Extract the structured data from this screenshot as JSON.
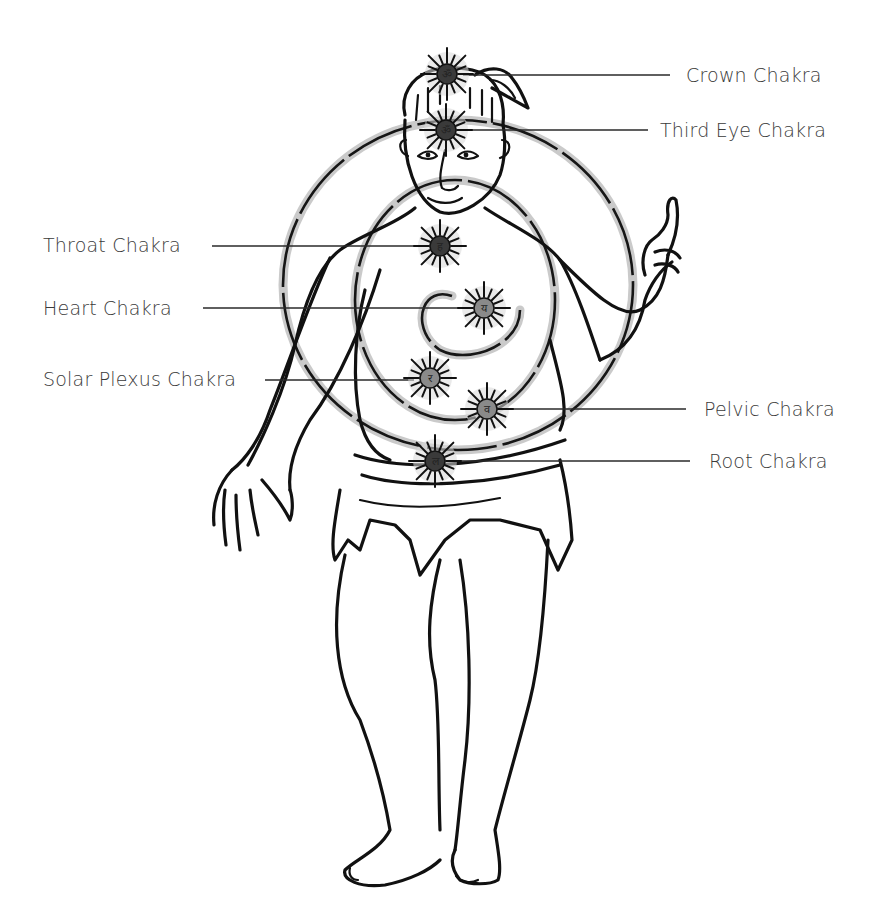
{
  "diagram": {
    "title": "",
    "colors": {
      "ink": "#111111",
      "label_text": "#3a3a3a",
      "halo": "#bdbdbd",
      "chakra_core_dark": "#3a3a3a",
      "chakra_core_light": "#8a8a8a",
      "background": "#ffffff"
    },
    "chakras": [
      {
        "id": "crown",
        "label": "Crown Chakra",
        "side": "right",
        "cx": 447,
        "cy": 74,
        "glyph": "ॐ",
        "label_x": 686,
        "label_y": 64,
        "line_x1": 463,
        "line_x2": 670
      },
      {
        "id": "third-eye",
        "label": "Third Eye Chakra",
        "side": "right",
        "cx": 446,
        "cy": 130,
        "glyph": "ॐ",
        "label_x": 660,
        "label_y": 119,
        "line_x1": 462,
        "line_x2": 648
      },
      {
        "id": "throat",
        "label": "Throat Chakra",
        "side": "left",
        "cx": 440,
        "cy": 246,
        "glyph": "ह",
        "label_x": 43,
        "label_y": 234,
        "line_x1": 212,
        "line_x2": 425
      },
      {
        "id": "heart",
        "label": "Heart Chakra",
        "side": "left",
        "cx": 484,
        "cy": 308,
        "glyph": "य",
        "label_x": 43,
        "label_y": 297,
        "line_x1": 203,
        "line_x2": 468
      },
      {
        "id": "solar-plexus",
        "label": "Solar Plexus Chakra",
        "side": "left",
        "cx": 430,
        "cy": 378,
        "glyph": "र",
        "label_x": 43,
        "label_y": 368,
        "line_x1": 265,
        "line_x2": 414
      },
      {
        "id": "pelvic",
        "label": "Pelvic Chakra",
        "side": "right",
        "cx": 487,
        "cy": 409,
        "glyph": "व",
        "label_x": 704,
        "label_y": 398,
        "line_x1": 505,
        "line_x2": 686
      },
      {
        "id": "root",
        "label": "Root Chakra",
        "side": "right",
        "cx": 435,
        "cy": 461,
        "glyph": "ल",
        "label_x": 709,
        "label_y": 450,
        "line_x1": 452,
        "line_x2": 690
      }
    ]
  }
}
